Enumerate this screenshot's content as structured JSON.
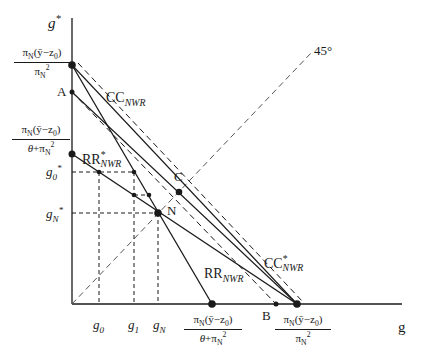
{
  "diagram": {
    "axes": {
      "y_label": "g*",
      "x_label": "g"
    },
    "curves": [
      {
        "name": "CC_NWR",
        "label_main": "CC",
        "label_sub": "NWR",
        "style": "solid"
      },
      {
        "name": "CC*_NWR",
        "label_main": "CC",
        "label_sup": "*",
        "label_sub": "NWR",
        "style": "solid"
      },
      {
        "name": "RR_NWR",
        "label_main": "RR",
        "label_sub": "NWR",
        "style": "solid"
      },
      {
        "name": "RR*_NWR",
        "label_main": "RR",
        "label_sup": "*",
        "label_sub": "NWR",
        "style": "solid"
      },
      {
        "name": "45-degree line",
        "label": "45°",
        "style": "dashed"
      }
    ],
    "points": {
      "A": "A",
      "B": "B",
      "C": "C",
      "N": "N"
    },
    "y_ticks": {
      "top_num": "πN(ȳ−z0)",
      "top_den": "πN²",
      "mid_num": "πN(ȳ−z0)",
      "mid_den": "θ+πN²",
      "g0_star": "g0*",
      "gN_star": "gN*"
    },
    "x_ticks": {
      "g0": "g0",
      "g1": "g1",
      "gN": "gN",
      "rr_num": "πN(ȳ−z0)",
      "rr_den": "θ+πN²",
      "cc_num": "πN(ȳ−z0)",
      "cc_den": "πN²"
    }
  }
}
